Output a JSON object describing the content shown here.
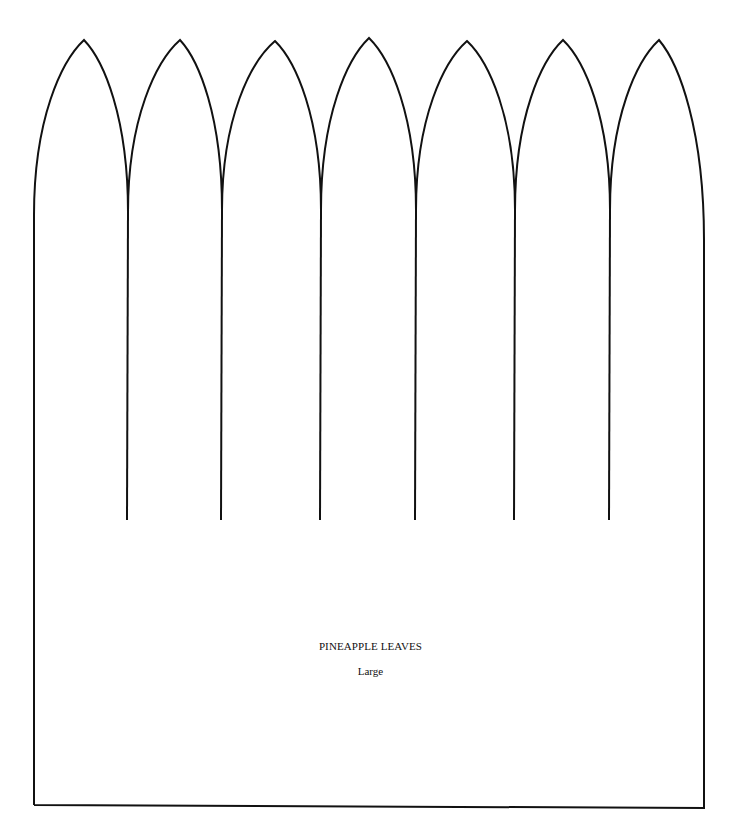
{
  "template": {
    "title": "PINEAPPLE LEAVES",
    "size_label": "Large",
    "stroke_color": "#111111",
    "background_color": "#ffffff",
    "leaf_count": 7,
    "peaks": [
      [
        84,
        40
      ],
      [
        180,
        40
      ],
      [
        275,
        41
      ],
      [
        369,
        38
      ],
      [
        467,
        41
      ],
      [
        563,
        40
      ],
      [
        659,
        40
      ]
    ],
    "valleys": [
      [
        128,
        212
      ],
      [
        222,
        210
      ],
      [
        321,
        210
      ],
      [
        416,
        210
      ],
      [
        515,
        210
      ],
      [
        610,
        210
      ]
    ],
    "cut_bottom_y": 520,
    "left_edge": {
      "top": [
        34,
        215
      ],
      "bottom": [
        34,
        805
      ]
    },
    "right_edge": {
      "top": [
        704,
        240
      ],
      "bottom": [
        704,
        808
      ]
    }
  }
}
